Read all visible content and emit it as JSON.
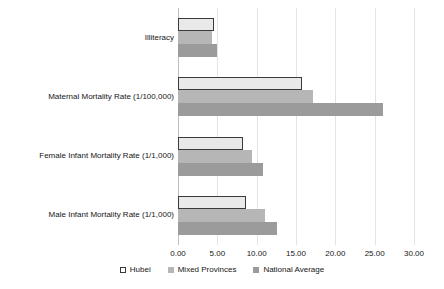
{
  "chart_data": {
    "type": "bar",
    "orientation": "horizontal",
    "title": "",
    "xlabel": "",
    "ylabel": "",
    "xlim": [
      0,
      30
    ],
    "xticks": [
      0,
      5,
      10,
      15,
      20,
      25,
      30
    ],
    "xtick_labels": [
      "0.00",
      "5.00",
      "10.00",
      "15.00",
      "20.00",
      "25.00",
      "30.00"
    ],
    "grid": true,
    "legend_position": "bottom",
    "categories": [
      "Illiteracy",
      "Maternal Mortality Rate (1/100,000)",
      "Female Infant Mortality Rate (1/1,000)",
      "Male Infant Mortality Rate (1/1,000)"
    ],
    "series": [
      {
        "name": "Hubei",
        "color": "#e9e9e9",
        "border_color": "#3a3a3a",
        "values": [
          4.6,
          15.7,
          8.2,
          8.7
        ]
      },
      {
        "name": "Mixed Provinces",
        "color": "#b6b6b6",
        "values": [
          4.3,
          17.2,
          9.4,
          11.1
        ]
      },
      {
        "name": "National Average",
        "color": "#9b9b9b",
        "values": [
          5.0,
          26.0,
          10.8,
          12.6
        ]
      }
    ]
  },
  "legend": {
    "items": [
      {
        "label": "Hubei",
        "swatch": "hubei-swatch"
      },
      {
        "label": "Mixed Provinces",
        "swatch": "mixed-provinces-swatch"
      },
      {
        "label": "National Average",
        "swatch": "national-average-swatch"
      }
    ]
  },
  "colors": {
    "background": "#ffffff",
    "grid": "#e3e3e3",
    "axis": "#bdbdbd",
    "text": "#161616"
  }
}
